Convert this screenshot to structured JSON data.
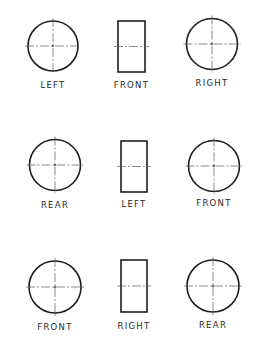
{
  "diagram": {
    "colors": {
      "background": "#ffffff",
      "outline": "#1e1e1e",
      "centerline": "#5a5a5a",
      "label": "#2a2a2a"
    },
    "rows": [
      {
        "views": [
          {
            "shape": "circle",
            "label": "LEFT",
            "cx": 53,
            "cy": 46,
            "r": 25
          },
          {
            "shape": "rectangle",
            "label": "FRONT",
            "x": 118,
            "y": 21,
            "w": 27,
            "h": 51
          },
          {
            "shape": "circle",
            "label": "RIGHT",
            "cx": 212,
            "cy": 44,
            "r": 25.5
          }
        ],
        "label_y": [
          85,
          85,
          83
        ]
      },
      {
        "views": [
          {
            "shape": "circle",
            "label": "REAR",
            "cx": 55,
            "cy": 165,
            "r": 25.5
          },
          {
            "shape": "rectangle",
            "label": "LEFT",
            "x": 121,
            "y": 141,
            "w": 26,
            "h": 51
          },
          {
            "shape": "circle",
            "label": "FRONT",
            "cx": 214,
            "cy": 166,
            "r": 25.5
          }
        ],
        "label_y": [
          205,
          204,
          203
        ]
      },
      {
        "views": [
          {
            "shape": "circle",
            "label": "FRONT",
            "cx": 55,
            "cy": 287,
            "r": 26
          },
          {
            "shape": "rectangle",
            "label": "RIGHT",
            "x": 121,
            "y": 260,
            "w": 26,
            "h": 52
          },
          {
            "shape": "circle",
            "label": "REAR",
            "cx": 213,
            "cy": 286,
            "r": 26
          }
        ],
        "label_y": [
          327,
          326,
          325
        ]
      }
    ]
  }
}
